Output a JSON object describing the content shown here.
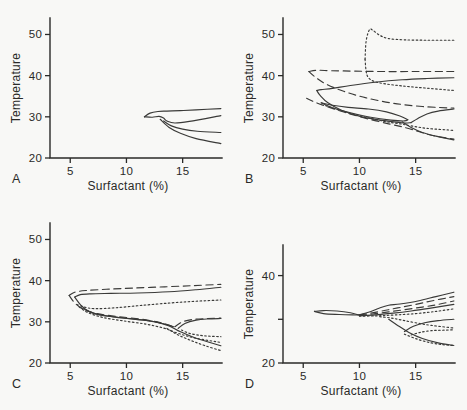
{
  "figure": {
    "background_color": "#f8f8f6",
    "ink_color": "#3a3a38",
    "panel_labels": [
      "A",
      "B",
      "C",
      "D"
    ]
  },
  "chart_data": [
    {
      "type": "line",
      "panel": "A",
      "title": "",
      "xlabel": "Surfactant (%)",
      "ylabel": "Temperature",
      "xlim": [
        3.2,
        18.5
      ],
      "ylim": [
        20,
        54
      ],
      "xticks": [
        5,
        10,
        15
      ],
      "xtick_labels": [
        "5",
        "10",
        "15"
      ],
      "yticks": [
        20,
        30,
        40,
        50
      ],
      "ytick_labels": [
        "20",
        "30",
        "40",
        "50"
      ],
      "grid": false,
      "legend": "none",
      "series": [
        {
          "name": "upper-boundary-solid",
          "style": "solid",
          "x": [
            11.6,
            12.1,
            12.8,
            13.6,
            14.8,
            16.2,
            18.4
          ],
          "y": [
            30.0,
            30.9,
            31.3,
            31.4,
            31.5,
            31.7,
            32.0
          ]
        },
        {
          "name": "middle-boundary-solid",
          "style": "solid",
          "x": [
            11.6,
            12.3,
            12.9,
            13.3,
            13.6,
            14.3,
            15.6,
            18.4
          ],
          "y": [
            30.0,
            29.9,
            30.1,
            29.7,
            29.0,
            28.5,
            28.9,
            30.3
          ]
        },
        {
          "name": "lower-boundary-solid",
          "style": "solid",
          "x": [
            13.3,
            14.0,
            15.0,
            16.3,
            18.4
          ],
          "y": [
            29.0,
            27.8,
            27.0,
            26.5,
            26.2
          ]
        },
        {
          "name": "lowest-boundary-solid",
          "style": "solid",
          "x": [
            13.0,
            13.8,
            14.8,
            16.2,
            18.4
          ],
          "y": [
            29.4,
            27.4,
            26.0,
            24.7,
            23.5
          ]
        }
      ]
    },
    {
      "type": "line",
      "panel": "B",
      "title": "",
      "xlabel": "Surfactant (%)",
      "ylabel": "Temperature",
      "xlim": [
        3.2,
        18.5
      ],
      "ylim": [
        20,
        54
      ],
      "xticks": [
        5,
        10,
        15
      ],
      "xtick_labels": [
        "5",
        "10",
        "15"
      ],
      "yticks": [
        20,
        30,
        40,
        50
      ],
      "ytick_labels": [
        "20",
        "30",
        "40",
        "50"
      ],
      "grid": false,
      "legend": "none",
      "series": [
        {
          "name": "dotted-peak-loop",
          "style": "dotted",
          "x": [
            10.5,
            10.6,
            10.9,
            11.2,
            11.8,
            12.6,
            14.0,
            16.0,
            18.4
          ],
          "y": [
            44.0,
            48.5,
            51.2,
            51.0,
            49.8,
            49.0,
            48.7,
            48.6,
            48.6
          ]
        },
        {
          "name": "dotted-descending",
          "style": "dotted",
          "x": [
            10.5,
            10.6,
            10.8,
            11.3,
            12.3,
            13.8,
            15.8,
            18.4
          ],
          "y": [
            44.0,
            41.0,
            39.5,
            38.6,
            38.0,
            37.5,
            37.0,
            36.4
          ]
        },
        {
          "name": "dashed-upper-loop-top",
          "style": "dashed",
          "x": [
            5.5,
            6.2,
            7.5,
            9.5,
            12.0,
            15.0,
            18.4
          ],
          "y": [
            41.0,
            41.3,
            41.2,
            41.1,
            41.0,
            41.0,
            41.0
          ]
        },
        {
          "name": "dashed-upper-loop-bottom",
          "style": "dashed",
          "x": [
            5.5,
            6.0,
            7.0,
            8.6,
            10.6,
            13.0,
            15.6,
            18.4
          ],
          "y": [
            41.0,
            39.8,
            38.0,
            36.2,
            34.6,
            33.3,
            32.5,
            32.1
          ]
        },
        {
          "name": "solid-rising-upper",
          "style": "solid",
          "x": [
            6.2,
            6.6,
            7.6,
            9.2,
            11.4,
            13.8,
            16.0,
            18.4
          ],
          "y": [
            36.4,
            36.6,
            36.9,
            37.6,
            38.4,
            39.0,
            39.3,
            39.5
          ]
        },
        {
          "name": "solid-left-descending",
          "style": "solid",
          "x": [
            6.2,
            6.5,
            7.2,
            8.4,
            10.2,
            12.4,
            13.9,
            14.6
          ],
          "y": [
            36.4,
            35.2,
            33.4,
            31.6,
            30.0,
            29.0,
            28.5,
            28.6
          ]
        },
        {
          "name": "solid-right-hook",
          "style": "solid",
          "x": [
            14.6,
            15.2,
            16.0,
            17.0,
            18.4
          ],
          "y": [
            28.6,
            29.6,
            30.7,
            31.4,
            31.9
          ]
        },
        {
          "name": "mixed-dashdot-left",
          "style": "dashed",
          "x": [
            5.3,
            6.0,
            7.2,
            8.8,
            10.6,
            12.6,
            14.2,
            15.4,
            16.6,
            18.4
          ],
          "y": [
            34.5,
            33.6,
            32.4,
            31.0,
            29.6,
            28.3,
            27.3,
            26.3,
            25.4,
            24.6
          ]
        },
        {
          "name": "solid-inner-lens-upper",
          "style": "solid",
          "x": [
            6.6,
            7.6,
            9.0,
            10.8,
            12.4,
            13.6,
            14.3
          ],
          "y": [
            33.4,
            32.8,
            32.3,
            31.9,
            31.2,
            30.2,
            29.3
          ]
        },
        {
          "name": "solid-inner-lens-lower",
          "style": "solid",
          "x": [
            6.6,
            7.6,
            9.2,
            11.0,
            12.8,
            14.0,
            14.3
          ],
          "y": [
            33.4,
            32.2,
            31.0,
            29.9,
            29.2,
            29.0,
            29.3
          ]
        },
        {
          "name": "dotted-lower-band",
          "style": "dotted",
          "x": [
            7.0,
            8.6,
            10.4,
            12.2,
            13.6,
            14.6,
            16.0,
            18.4
          ],
          "y": [
            32.7,
            31.3,
            30.0,
            28.9,
            28.3,
            27.8,
            27.2,
            26.7
          ]
        },
        {
          "name": "solid-lowest",
          "style": "solid",
          "x": [
            13.8,
            14.6,
            15.6,
            16.8,
            18.4
          ],
          "y": [
            28.8,
            27.4,
            26.2,
            25.3,
            24.4
          ]
        }
      ]
    },
    {
      "type": "line",
      "panel": "C",
      "title": "",
      "xlabel": "Surfactant (%)",
      "ylabel": "Temperature",
      "xlim": [
        3.2,
        18.5
      ],
      "ylim": [
        20,
        54
      ],
      "xticks": [
        5,
        10,
        15
      ],
      "xtick_labels": [
        "5",
        "10",
        "15"
      ],
      "yticks": [
        20,
        30,
        40,
        50
      ],
      "ytick_labels": [
        "20",
        "30",
        "40",
        "50"
      ],
      "grid": false,
      "legend": "none",
      "series": [
        {
          "name": "dashed-outer-loop-top",
          "style": "dashed",
          "x": [
            4.9,
            5.4,
            6.4,
            8.2,
            10.6,
            13.4,
            16.0,
            18.4
          ],
          "y": [
            36.4,
            37.2,
            37.6,
            37.9,
            38.2,
            38.5,
            38.8,
            39.1
          ]
        },
        {
          "name": "dashed-outer-loop-bottom",
          "style": "dashed",
          "x": [
            4.9,
            5.4,
            6.2,
            7.4,
            9.2,
            11.4,
            13.0,
            14.0
          ],
          "y": [
            36.4,
            34.6,
            33.0,
            32.0,
            31.3,
            30.6,
            29.8,
            29.0
          ]
        },
        {
          "name": "solid-inner-loop-top",
          "style": "solid",
          "x": [
            5.4,
            5.9,
            6.8,
            8.6,
            11.0,
            13.8,
            16.2,
            18.4
          ],
          "y": [
            36.0,
            36.6,
            36.8,
            36.9,
            37.0,
            37.3,
            37.8,
            38.4
          ]
        },
        {
          "name": "solid-inner-loop-bottom",
          "style": "solid",
          "x": [
            5.4,
            5.9,
            6.6,
            7.8,
            9.6,
            11.6,
            13.2,
            14.2
          ],
          "y": [
            36.0,
            34.2,
            32.6,
            31.6,
            31.0,
            30.4,
            29.6,
            28.8
          ]
        },
        {
          "name": "dotted-outer-band",
          "style": "dotted",
          "x": [
            5.6,
            6.2,
            7.2,
            9.0,
            11.4,
            14.0,
            16.2,
            18.4
          ],
          "y": [
            34.2,
            33.6,
            33.2,
            33.4,
            34.0,
            34.6,
            35.0,
            35.3
          ]
        },
        {
          "name": "dotted-lower-descending",
          "style": "dotted",
          "x": [
            5.8,
            6.6,
            8.0,
            9.8,
            11.8,
            13.4,
            14.6,
            16.2,
            18.4
          ],
          "y": [
            33.6,
            32.2,
            31.0,
            30.2,
            29.4,
            28.4,
            27.2,
            26.0,
            25.0
          ]
        },
        {
          "name": "solid-center-descending",
          "style": "solid",
          "x": [
            6.0,
            7.2,
            8.8,
            10.8,
            12.6,
            13.8,
            14.8,
            16.2,
            18.4
          ],
          "y": [
            33.4,
            32.0,
            31.2,
            30.6,
            30.0,
            29.0,
            27.6,
            26.0,
            24.2
          ]
        },
        {
          "name": "solid-right-hook-upper",
          "style": "solid",
          "x": [
            14.6,
            15.2,
            16.2,
            17.2,
            18.4
          ],
          "y": [
            28.4,
            29.6,
            30.4,
            30.7,
            30.8
          ]
        },
        {
          "name": "dashed-right-hook",
          "style": "dashed",
          "x": [
            14.3,
            15.0,
            16.0,
            17.2,
            18.4
          ],
          "y": [
            28.8,
            30.0,
            30.6,
            30.8,
            30.9
          ]
        },
        {
          "name": "dotted-right-hook",
          "style": "dotted",
          "x": [
            14.9,
            15.6,
            16.6,
            17.5,
            18.4
          ],
          "y": [
            28.0,
            27.2,
            26.7,
            26.5,
            26.4
          ]
        },
        {
          "name": "dotted-lowest",
          "style": "dotted",
          "x": [
            13.6,
            14.6,
            15.8,
            17.0,
            18.4
          ],
          "y": [
            28.4,
            26.8,
            25.4,
            24.2,
            23.0
          ]
        }
      ]
    },
    {
      "type": "line",
      "panel": "D",
      "title": "",
      "xlabel": "Surfactant (%)",
      "ylabel": "Temperature",
      "xlim": [
        3.2,
        18.5
      ],
      "ylim": [
        20,
        47
      ],
      "xticks": [
        5,
        10,
        15
      ],
      "xtick_labels": [
        "5",
        "10",
        "15"
      ],
      "yticks": [
        20,
        30,
        40
      ],
      "ytick_labels": [
        "20",
        "",
        "40"
      ],
      "grid": false,
      "legend": "none",
      "series": [
        {
          "name": "solid-left-lens-top",
          "style": "solid",
          "x": [
            6.0,
            6.8,
            8.0,
            9.2,
            9.9
          ],
          "y": [
            31.8,
            32.0,
            31.9,
            31.5,
            31.0
          ]
        },
        {
          "name": "solid-left-lens-bottom",
          "style": "solid",
          "x": [
            6.0,
            6.8,
            8.2,
            9.4,
            9.9
          ],
          "y": [
            31.8,
            31.3,
            31.1,
            31.0,
            31.0
          ]
        },
        {
          "name": "solid-upper-rising",
          "style": "solid",
          "x": [
            9.9,
            10.8,
            11.8,
            12.6,
            13.6,
            15.2,
            16.8,
            18.4
          ],
          "y": [
            31.0,
            31.6,
            32.6,
            33.2,
            33.5,
            34.2,
            35.2,
            36.2
          ]
        },
        {
          "name": "dashed-rising-upper",
          "style": "dashed",
          "x": [
            10.0,
            11.0,
            12.2,
            13.4,
            14.8,
            16.4,
            18.4
          ],
          "y": [
            31.0,
            31.4,
            32.0,
            32.6,
            33.3,
            34.2,
            35.2
          ]
        },
        {
          "name": "dashed-rising-lower",
          "style": "dashed",
          "x": [
            10.0,
            11.2,
            12.6,
            14.0,
            15.6,
            17.0,
            18.4
          ],
          "y": [
            30.9,
            31.2,
            31.7,
            32.2,
            32.8,
            33.4,
            34.2
          ]
        },
        {
          "name": "solid-rising-mid",
          "style": "solid",
          "x": [
            10.0,
            11.4,
            13.0,
            14.6,
            16.2,
            18.4
          ],
          "y": [
            30.8,
            31.0,
            31.4,
            31.9,
            32.5,
            33.4
          ]
        },
        {
          "name": "dotted-rising-low",
          "style": "dotted",
          "x": [
            10.0,
            11.6,
            13.2,
            15.0,
            16.8,
            18.4
          ],
          "y": [
            30.7,
            30.8,
            31.0,
            31.3,
            31.8,
            32.4
          ]
        },
        {
          "name": "dotted-descending-branch",
          "style": "dotted",
          "x": [
            11.8,
            12.8,
            13.8,
            15.0,
            16.4,
            18.4
          ],
          "y": [
            30.6,
            30.3,
            29.8,
            29.2,
            28.6,
            28.0
          ]
        },
        {
          "name": "solid-right-hook-upper",
          "style": "solid",
          "x": [
            14.0,
            14.8,
            15.8,
            17.0,
            18.4
          ],
          "y": [
            27.2,
            28.4,
            29.2,
            29.7,
            30.0
          ]
        },
        {
          "name": "dotted-right-hook",
          "style": "dotted",
          "x": [
            14.6,
            15.4,
            16.4,
            17.4,
            18.4
          ],
          "y": [
            26.4,
            27.0,
            27.4,
            27.5,
            27.6
          ]
        },
        {
          "name": "solid-lower-descending",
          "style": "solid",
          "x": [
            12.6,
            13.4,
            14.4,
            15.6,
            17.0,
            18.4
          ],
          "y": [
            30.0,
            28.6,
            27.0,
            25.6,
            24.6,
            24.0
          ]
        },
        {
          "name": "dotted-lowest",
          "style": "dotted",
          "x": [
            14.0,
            15.2,
            16.4,
            17.4,
            18.4
          ],
          "y": [
            26.6,
            25.4,
            24.6,
            24.2,
            24.0
          ]
        }
      ]
    }
  ]
}
